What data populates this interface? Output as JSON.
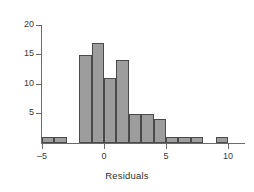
{
  "chart_data": {
    "type": "bar",
    "title": "",
    "subtitle": "",
    "xlabel": "Residuals",
    "ylabel": "",
    "binwidth": 1,
    "bin_starts": [
      -5,
      -4,
      -3,
      -2,
      -1,
      0,
      1,
      2,
      3,
      4,
      5,
      6,
      7,
      8,
      9
    ],
    "categories": [
      "-5",
      "-4",
      "-3",
      "-2",
      "-1",
      "0",
      "1",
      "2",
      "3",
      "4",
      "5",
      "6",
      "7",
      "8",
      "9"
    ],
    "values": [
      1,
      1,
      0,
      15,
      17,
      11,
      14,
      5,
      5,
      4,
      1,
      1,
      1,
      0,
      1
    ],
    "xlim": [
      -5.6,
      11.4
    ],
    "ylim": [
      0,
      20
    ],
    "xticks": [
      -5,
      0,
      5,
      10
    ],
    "xtick_labels": [
      "–5",
      "0",
      "5",
      "10"
    ],
    "yticks": [
      5,
      10,
      15,
      20
    ],
    "ytick_labels": [
      "5",
      "10",
      "15",
      "20"
    ],
    "grid": false,
    "legend": null,
    "bar_fill_color": "#9d9d9d",
    "bar_edge_color": "#4a4a4a",
    "axis_color": "#6b6b6b",
    "text_color": "#3a3a3a"
  }
}
